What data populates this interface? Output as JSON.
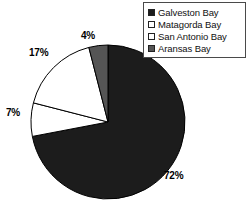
{
  "chart_data": {
    "type": "pie",
    "title": "",
    "subtitle": "",
    "legend_position": "top-right",
    "grid": false,
    "start_angle_deg": 90,
    "direction": "clockwise",
    "categories": [
      "Galveston Bay",
      "Matagorda Bay",
      "San Antonio Bay",
      "Aransas Bay"
    ],
    "values": [
      72,
      7,
      17,
      4
    ],
    "unit": "%",
    "slices": [
      {
        "label": "Galveston Bay",
        "value": 72,
        "value_label": "72%",
        "color": "#1c1c1c",
        "swatch": "dark"
      },
      {
        "label": "Matagorda Bay",
        "value": 7,
        "value_label": "7%",
        "color": "#ffffff",
        "swatch": "white"
      },
      {
        "label": "San Antonio Bay",
        "value": 17,
        "value_label": "17%",
        "color": "#ffffff",
        "swatch": "white"
      },
      {
        "label": "Aransas Bay",
        "value": 4,
        "value_label": "4%",
        "color": "#555555",
        "swatch": "gray"
      }
    ]
  },
  "legend": {
    "items": [
      {
        "label": "Galveston Bay",
        "swatch_color": "#1c1c1c"
      },
      {
        "label": "Matagorda Bay",
        "swatch_color": "#ffffff"
      },
      {
        "label": "San Antonio Bay",
        "swatch_color": "#ffffff"
      },
      {
        "label": "Aransas Bay",
        "swatch_color": "#555555"
      }
    ]
  },
  "labels": {
    "galveston_pct": "72%",
    "matagorda_pct": "7%",
    "sanantonio_pct": "17%",
    "aransas_pct": "4%"
  },
  "colors": {
    "dark_fill": "#1c1c1c",
    "gray_fill": "#555555",
    "white_fill": "#ffffff",
    "outline": "#000000",
    "background": "#ffffff"
  }
}
